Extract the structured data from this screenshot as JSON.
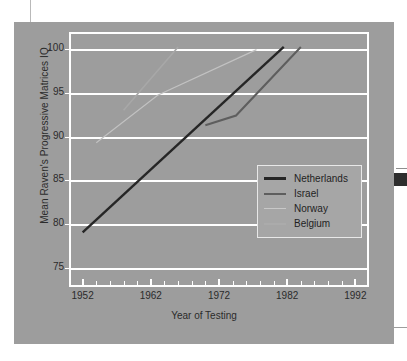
{
  "figure": {
    "background_color": "#9d9d9d",
    "grid_color": "#ffffff"
  },
  "chart_data": {
    "type": "line",
    "title": "",
    "xlabel": "Year of Testing",
    "ylabel": "Mean Raven's Progressive Matrices IQ",
    "xlim": [
      1950,
      1994
    ],
    "ylim": [
      73,
      102
    ],
    "xticks": [
      1952,
      1962,
      1972,
      1982,
      1992
    ],
    "xtick_labels": [
      "1952",
      "1962",
      "1972",
      "1982",
      "1992"
    ],
    "minor_xtick_interval": 2,
    "yticks": [
      75,
      80,
      85,
      90,
      95,
      100
    ],
    "ytick_labels": [
      "75",
      "80",
      "85",
      "90",
      "95",
      "100"
    ],
    "grid": true,
    "grid_axis": "y",
    "legend_position": "center-right",
    "series": [
      {
        "name": "Netherlands",
        "color": "#262626",
        "width": 2.4,
        "x": [
          1952,
          1981.5
        ],
        "y": [
          79.2,
          100.3
        ]
      },
      {
        "name": "Israel",
        "color": "#5e5e5e",
        "width": 2.0,
        "x": [
          1970,
          1974.5,
          1984
        ],
        "y": [
          91.4,
          92.5,
          100.3
        ]
      },
      {
        "name": "Norway",
        "color": "#c2c2c2",
        "width": 1.2,
        "x": [
          1954,
          1963,
          1977.5
        ],
        "y": [
          89.4,
          94.8,
          100.0
        ]
      },
      {
        "name": "Belgium",
        "color": "#a8a8a8",
        "width": 1.6,
        "x": [
          1958,
          1966
        ],
        "y": [
          93.1,
          100.3
        ]
      }
    ]
  },
  "legend": {
    "entries": [
      {
        "label": "Netherlands",
        "color": "#262626",
        "width": 3.0
      },
      {
        "label": "Israel",
        "color": "#5e5e5e",
        "width": 2.4
      },
      {
        "label": "Norway",
        "color": "#c8c8c8",
        "width": 1.4
      },
      {
        "label": "Belgium",
        "color": "#ababab",
        "width": 2.0
      }
    ]
  }
}
